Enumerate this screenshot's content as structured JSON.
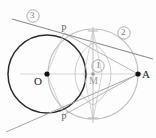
{
  "figure": {
    "type": "geometry-construction-diagram",
    "background_color": "#fdfdfd",
    "width": 156,
    "height": 138
  },
  "colors": {
    "primary_circle": "#2b2b2b",
    "secondary_circle": "#bdbdbd",
    "construction_line": "#b6b6b6",
    "tangent_line": "#8f8f8f",
    "axis_line": "#c9c9c9",
    "point_fill": "#111111",
    "point_fill_light": "#9c9c9c",
    "label_dark": "#1a1a1a",
    "label_mid": "#6f6f6f",
    "label_light": "#9a9a9a"
  },
  "points": [
    {
      "id": "O",
      "label": "O",
      "x": 47,
      "y": 74,
      "style": "dark",
      "label_dx": -11,
      "label_dy": 4
    },
    {
      "id": "A",
      "label": "A",
      "x": 138,
      "y": 74,
      "style": "dark",
      "label_dx": 5,
      "label_dy": 4
    },
    {
      "id": "M",
      "label": "M",
      "x": 93,
      "y": 74,
      "style": "light",
      "label_dx": -3,
      "label_dy": 10
    },
    {
      "id": "P",
      "label": "P",
      "x": 64,
      "y": 33,
      "style": "none",
      "label_dx": -2,
      "label_dy": -3
    },
    {
      "id": "Pp",
      "label": "P",
      "prime": "'",
      "x": 64,
      "y": 115,
      "style": "none",
      "label_dx": -2,
      "label_dy": 9
    }
  ],
  "markers": [
    {
      "id": "1",
      "label": "1",
      "x": 98,
      "y": 67,
      "shape": "circled-number",
      "color": "#7a7a7a"
    },
    {
      "id": "2",
      "label": "2",
      "x": 124,
      "y": 33,
      "shape": "circled-number",
      "color": "#7a7a7a"
    },
    {
      "id": "3",
      "label": "3",
      "x": 33,
      "y": 16,
      "shape": "circled-number",
      "color": "#7a7a7a"
    }
  ],
  "circles": [
    {
      "name": "circle-O-primary",
      "cx": 47,
      "cy": 74,
      "r": 39,
      "stroke": "#2b2b2b",
      "width": 1.4,
      "label": "O"
    },
    {
      "name": "circle-M-secondary",
      "cx": 93,
      "cy": 74,
      "r": 45,
      "stroke": "#bdbdbd",
      "width": 1.1,
      "label": "2"
    }
  ],
  "arcs": [
    {
      "name": "bisector-arc-left",
      "cx": 75,
      "cy": 74,
      "r": 36,
      "desc": "construction arc from left centre"
    },
    {
      "name": "bisector-arc-right",
      "cx": 111,
      "cy": 74,
      "r": 36,
      "desc": "construction arc from right centre"
    }
  ],
  "lines": [
    {
      "name": "line-OA-axis",
      "x1": 20,
      "y1": 74,
      "x2": 145,
      "y2": 74,
      "stroke": "#c9c9c9",
      "width": 0.8
    },
    {
      "name": "tangent-line-3",
      "x1": 14,
      "y1": 20,
      "x2": 152,
      "y2": 60,
      "stroke": "#8f8f8f",
      "width": 1.0,
      "label": "3"
    },
    {
      "name": "tangent-line-lower",
      "x1": 8,
      "y1": 131,
      "x2": 140,
      "y2": 73,
      "stroke": "#a8a8a8",
      "width": 1.0
    },
    {
      "name": "chord-PA",
      "x1": 64,
      "y1": 33,
      "x2": 138,
      "y2": 74,
      "stroke": "#b6b6b6",
      "width": 0.9
    },
    {
      "name": "chord-PpA",
      "x1": 64,
      "y1": 115,
      "x2": 138,
      "y2": 74,
      "stroke": "#b6b6b6",
      "width": 0.9
    },
    {
      "name": "chord-OP",
      "x1": 47,
      "y1": 74,
      "x2": 64,
      "y2": 33,
      "stroke": "#c4c4c4",
      "width": 0.8
    },
    {
      "name": "chord-OPp",
      "x1": 47,
      "y1": 74,
      "x2": 64,
      "y2": 115,
      "stroke": "#c4c4c4",
      "width": 0.8
    },
    {
      "name": "perp-bisector-vertical",
      "x1": 93,
      "y1": 26,
      "x2": 93,
      "y2": 124,
      "stroke": "#bcbcbc",
      "width": 0.9
    },
    {
      "name": "apex-left-upper",
      "x1": 93,
      "y1": 30,
      "x2": 84,
      "y2": 74,
      "stroke": "#c6c6c6",
      "width": 0.8
    },
    {
      "name": "apex-right-upper",
      "x1": 93,
      "y1": 30,
      "x2": 102,
      "y2": 74,
      "stroke": "#c6c6c6",
      "width": 0.8
    },
    {
      "name": "apex-left-lower",
      "x1": 93,
      "y1": 119,
      "x2": 84,
      "y2": 74,
      "stroke": "#c6c6c6",
      "width": 0.8
    },
    {
      "name": "apex-right-lower",
      "x1": 93,
      "y1": 119,
      "x2": 102,
      "y2": 74,
      "stroke": "#c6c6c6",
      "width": 0.8
    }
  ],
  "labels": {
    "O": "O",
    "A": "A",
    "M": "M",
    "P_upper": "P",
    "P_lower": "P",
    "prime": "'",
    "marker_1": "1",
    "marker_2": "2",
    "marker_3": "3"
  }
}
